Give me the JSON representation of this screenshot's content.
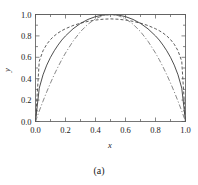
{
  "chart_data": {
    "type": "line",
    "title": "",
    "subtitle": "",
    "xlabel": "x",
    "ylabel": "y",
    "xlim": [
      0.0,
      1.0
    ],
    "ylim": [
      0.0,
      1.0
    ],
    "grid": false,
    "legend": "none",
    "xticks": [
      "0.0",
      "0.2",
      "0.4",
      "0.6",
      "0.8",
      "1.0"
    ],
    "xtick_values": [
      0.0,
      0.2,
      0.4,
      0.6,
      0.8,
      1.0
    ],
    "yticks": [
      "0.0",
      "0.2",
      "0.4",
      "0.6",
      "0.8",
      "1.0"
    ],
    "ytick_values": [
      0.0,
      0.2,
      0.4,
      0.6,
      0.8,
      1.0
    ],
    "x": [
      0.0,
      0.025,
      0.05,
      0.075,
      0.1,
      0.125,
      0.15,
      0.175,
      0.2,
      0.25,
      0.3,
      0.35,
      0.4,
      0.45,
      0.5,
      0.55,
      0.6,
      0.65,
      0.7,
      0.75,
      0.8,
      0.825,
      0.85,
      0.875,
      0.9,
      0.925,
      0.95,
      0.975,
      1.0
    ],
    "series": [
      {
        "name": "outer-dashed",
        "style": "dashed",
        "color": "#4a4a4a",
        "width": 0.9,
        "values": [
          0.0,
          0.563,
          0.661,
          0.722,
          0.766,
          0.8,
          0.827,
          0.849,
          0.867,
          0.897,
          0.919,
          0.936,
          0.948,
          0.956,
          0.959,
          0.956,
          0.948,
          0.936,
          0.919,
          0.897,
          0.867,
          0.849,
          0.827,
          0.8,
          0.766,
          0.722,
          0.661,
          0.563,
          0.0
        ]
      },
      {
        "name": "middle-solid",
        "style": "solid",
        "color": "#3a3a3a",
        "width": 0.9,
        "values": [
          0.0,
          0.312,
          0.436,
          0.527,
          0.6,
          0.661,
          0.714,
          0.761,
          0.8,
          0.866,
          0.917,
          0.954,
          0.98,
          0.995,
          1.0,
          0.995,
          0.98,
          0.954,
          0.917,
          0.866,
          0.8,
          0.761,
          0.714,
          0.661,
          0.6,
          0.527,
          0.436,
          0.312,
          0.0
        ]
      },
      {
        "name": "inner-dashdot",
        "style": "dashdot",
        "color": "#7a7a7a",
        "width": 0.9,
        "values": [
          0.0,
          0.098,
          0.19,
          0.278,
          0.36,
          0.438,
          0.51,
          0.578,
          0.64,
          0.75,
          0.84,
          0.91,
          0.96,
          0.99,
          1.0,
          0.99,
          0.96,
          0.91,
          0.84,
          0.75,
          0.64,
          0.578,
          0.51,
          0.438,
          0.36,
          0.278,
          0.19,
          0.098,
          0.0
        ]
      }
    ],
    "top_reference_line": {
      "name": "top-envelope",
      "y": 1.0,
      "color": "#8a8a8a",
      "width": 0.8
    }
  },
  "caption": {
    "label": "(a)"
  },
  "colors": {
    "frame": "#555555",
    "text": "#1a1a1a",
    "background": "#ffffff"
  }
}
